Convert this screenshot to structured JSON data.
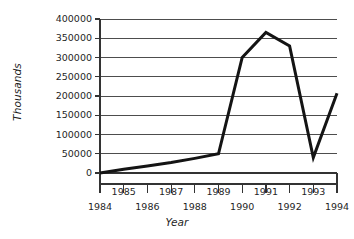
{
  "chart_data": {
    "type": "line",
    "title": "",
    "xlabel": "Year",
    "ylabel": "Thousands",
    "x": [
      1984,
      1985,
      1986,
      1987,
      1988,
      1989,
      1990,
      1991,
      1992,
      1993,
      1994
    ],
    "values": [
      0,
      10000,
      18000,
      27000,
      38000,
      50000,
      300000,
      365000,
      330000,
      40000,
      207000
    ],
    "series": [
      {
        "name": "Thousands",
        "values": [
          0,
          10000,
          18000,
          27000,
          38000,
          50000,
          300000,
          365000,
          330000,
          40000,
          207000
        ]
      }
    ],
    "xlim": [
      1984,
      1994
    ],
    "ylim": [
      0,
      400000
    ],
    "y_ticks": [
      0,
      50000,
      100000,
      150000,
      200000,
      250000,
      300000,
      350000,
      400000
    ],
    "y_tick_labels": [
      "0",
      "50000",
      "100000",
      "150000",
      "200000",
      "250000",
      "300000",
      "350000",
      "400000"
    ],
    "x_ticks": [
      1984,
      1985,
      1986,
      1987,
      1988,
      1989,
      1990,
      1991,
      1992,
      1993,
      1994
    ],
    "x_tick_labels_upper_row": [
      "1985",
      "1987",
      "1989",
      "1991",
      "1993"
    ],
    "x_tick_labels_lower_row": [
      "1984",
      "1986",
      "1988",
      "1990",
      "1992",
      "1994"
    ],
    "grid": true,
    "grid_axis": "y",
    "legend": "none",
    "line_color": "#141414",
    "grid_color": "#4d4d4d",
    "axis_color": "#333333",
    "background_color": "#ffffff"
  }
}
